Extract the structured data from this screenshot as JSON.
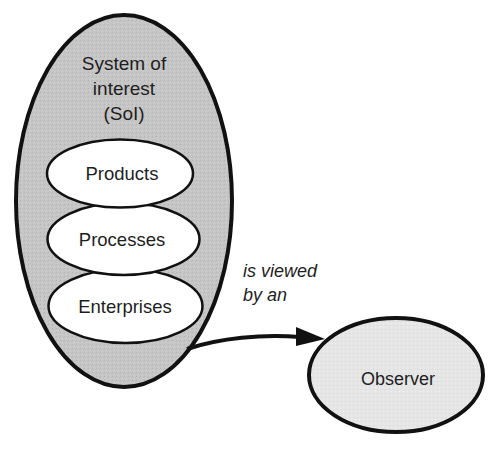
{
  "diagram": {
    "system": {
      "title_lines": [
        "System of",
        "interest",
        "(SoI)"
      ],
      "fill": "#c4c4c4",
      "stroke": "#111111"
    },
    "components": [
      {
        "label": "Products"
      },
      {
        "label": "Processes"
      },
      {
        "label": "Enterprises"
      }
    ],
    "relation": {
      "label_lines": [
        "is viewed",
        "by an"
      ]
    },
    "observer": {
      "label": "Observer",
      "fill": "#e4e4e4"
    }
  }
}
